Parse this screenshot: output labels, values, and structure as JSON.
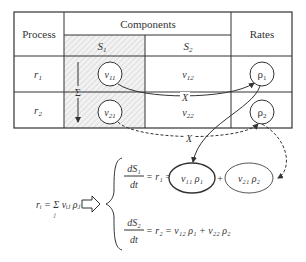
{
  "table": {
    "header_process": "Process",
    "header_components": "Components",
    "header_rates": "Rates",
    "components": [
      "S",
      "S"
    ],
    "component_subs": [
      "1",
      "2"
    ],
    "rows": [
      {
        "process": "r",
        "process_sub": "1",
        "s1": "ν",
        "s1_sub": "11",
        "s2": "ν",
        "s2_sub": "12",
        "rate": "ρ",
        "rate_sub": "1"
      },
      {
        "process": "r",
        "process_sub": "2",
        "s1": "ν",
        "s1_sub": "21",
        "s2": "ν",
        "s2_sub": "22",
        "rate": "ρ",
        "rate_sub": "2"
      }
    ],
    "sum_symbol": "Σ",
    "multiply_symbol": "X"
  },
  "equations": {
    "general": "rᵢ = Σ νᵢⱼ ρⱼ",
    "general_index": "j",
    "eq1_lhs_num": "dS₁",
    "eq1_lhs_den": "dt",
    "eq1_mid": "= r₁ =",
    "eq1_term1": "ν₁₁ ρ₁",
    "eq1_plus": "+",
    "eq1_term2": "ν₂₁ ρ₂",
    "eq2_lhs_num": "dS₂",
    "eq2_lhs_den": "dt",
    "eq2_rhs": "= r₂ = ν₁₂ ρ₁ + ν₂₂ ρ₂"
  }
}
